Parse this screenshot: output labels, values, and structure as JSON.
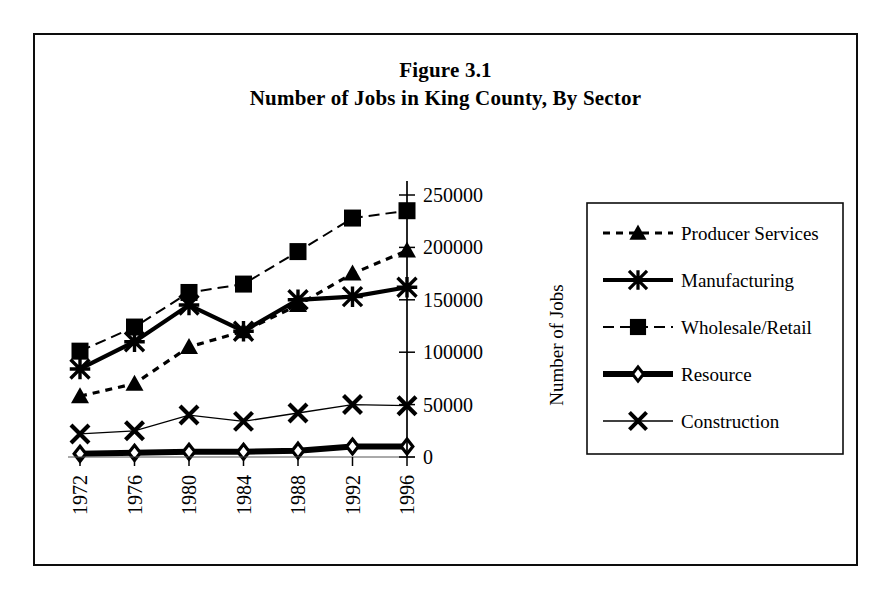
{
  "figure": {
    "title_line_1": "Figure 3.1",
    "title_line_2": "Number of Jobs in King County, By Sector",
    "border_color": "#0d0d0d"
  },
  "axes": {
    "y_title": "Number of Jobs",
    "y_ticks": [
      "0",
      "50000",
      "100000",
      "150000",
      "200000",
      "250000"
    ],
    "x_ticks": [
      "1972",
      "1976",
      "1980",
      "1984",
      "1988",
      "1992",
      "1996"
    ],
    "y_axis_position": "right",
    "x_label_rotation": "-90"
  },
  "legend": {
    "position": "right",
    "items": [
      {
        "label": "Producer Services",
        "marker": "triangle",
        "line": "dashed"
      },
      {
        "label": "Manufacturing",
        "marker": "asterisk",
        "line": "solid-thick"
      },
      {
        "label": "Wholesale/Retail",
        "marker": "square",
        "line": "dash-dot"
      },
      {
        "label": "Resource",
        "marker": "diamond-open",
        "line": "solid-extra-thick"
      },
      {
        "label": "Construction",
        "marker": "cross",
        "line": "solid-thin"
      }
    ]
  },
  "chart_data": {
    "type": "line",
    "title": "Figure 3.1 Number of Jobs in King County, By Sector",
    "xlabel": "",
    "ylabel": "Number of Jobs",
    "categories": [
      "1972",
      "1976",
      "1980",
      "1984",
      "1988",
      "1992",
      "1996"
    ],
    "x": [
      1972,
      1976,
      1980,
      1984,
      1988,
      1992,
      1996
    ],
    "ylim": [
      0,
      250000
    ],
    "ytick_values": [
      0,
      50000,
      100000,
      150000,
      200000,
      250000
    ],
    "grid": false,
    "legend_position": "right",
    "series": [
      {
        "name": "Producer Services",
        "marker": "triangle",
        "line": "dashed",
        "values": [
          58000,
          70000,
          105000,
          120000,
          145000,
          175000,
          197000
        ]
      },
      {
        "name": "Manufacturing",
        "marker": "asterisk",
        "line": "solid-thick",
        "values": [
          84000,
          110000,
          145000,
          120000,
          150000,
          153000,
          162000
        ]
      },
      {
        "name": "Wholesale/Retail",
        "marker": "square",
        "line": "dash-dot",
        "values": [
          101000,
          124000,
          157000,
          165000,
          196000,
          228000,
          235000
        ]
      },
      {
        "name": "Resource",
        "marker": "diamond-open",
        "line": "solid-extra-thick",
        "values": [
          3000,
          4000,
          5000,
          5000,
          6000,
          10000,
          10000
        ]
      },
      {
        "name": "Construction",
        "marker": "cross",
        "line": "solid-thin",
        "values": [
          22000,
          25000,
          40000,
          34000,
          42000,
          50000,
          49000
        ]
      }
    ]
  }
}
